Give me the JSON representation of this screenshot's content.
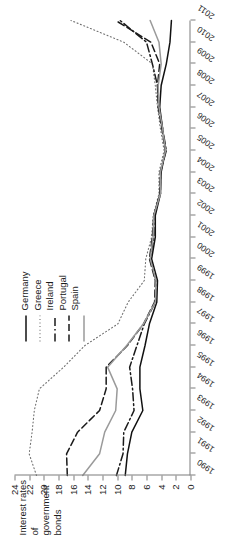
{
  "chart_data": {
    "type": "line",
    "title": "",
    "ylabel": "Interest rates of government bonds",
    "xlabel": "",
    "grid": false,
    "legend_position": "top-right",
    "ylim": [
      0,
      24
    ],
    "ytick_labels": [
      "0",
      "2",
      "4",
      "6",
      "8",
      "10",
      "12",
      "14",
      "16",
      "18",
      "20",
      "22",
      "24"
    ],
    "xlim": [
      1990,
      2011
    ],
    "x": [
      1990,
      1991,
      1992,
      1993,
      1994,
      1995,
      1996,
      1997,
      1998,
      1999,
      2000,
      2001,
      2002,
      2003,
      2004,
      2005,
      2006,
      2007,
      2008,
      2009,
      2010,
      2011
    ],
    "xtick_labels": [
      "1990",
      "1991",
      "1992",
      "1993",
      "1994",
      "1995",
      "1996",
      "1997",
      "1998",
      "1999",
      "2000",
      "2001",
      "2002",
      "2003",
      "2004",
      "2005",
      "2006",
      "2007",
      "2008",
      "2009",
      "2010",
      "2011"
    ],
    "series": [
      {
        "name": "Germany",
        "style": "solid",
        "color": "#111111",
        "values": [
          8.9,
          8.6,
          8.0,
          6.5,
          6.9,
          6.9,
          6.2,
          5.6,
          4.6,
          4.5,
          5.3,
          4.8,
          4.8,
          4.1,
          4.0,
          3.4,
          3.8,
          4.2,
          4.0,
          3.3,
          2.8,
          2.6
        ]
      },
      {
        "name": "Greece",
        "style": "dotted",
        "color": "#6f6f6f",
        "values": [
          21.0,
          22.0,
          21.6,
          21.3,
          20.6,
          17.3,
          14.4,
          9.9,
          8.5,
          6.3,
          6.1,
          5.3,
          5.1,
          4.3,
          4.3,
          3.6,
          4.1,
          4.5,
          4.8,
          5.2,
          9.1,
          16.3
        ]
      },
      {
        "name": "Ireland",
        "style": "dashdot",
        "color": "#1a1a1a",
        "values": [
          10.1,
          9.2,
          9.1,
          7.7,
          7.9,
          8.3,
          7.3,
          6.3,
          4.8,
          4.7,
          5.5,
          5.0,
          5.0,
          4.1,
          4.1,
          3.3,
          3.8,
          4.3,
          4.5,
          5.2,
          6.0,
          9.6
        ]
      },
      {
        "name": "Portugal",
        "style": "dashed",
        "color": "#1a1a1a",
        "values": [
          16.8,
          16.9,
          15.4,
          12.4,
          11.5,
          11.5,
          8.6,
          6.4,
          4.9,
          4.8,
          5.6,
          5.2,
          5.0,
          4.2,
          4.1,
          3.4,
          3.9,
          4.4,
          4.5,
          4.2,
          5.4,
          10.2
        ]
      },
      {
        "name": "Spain",
        "style": "solid",
        "color": "#9a9a9a",
        "values": [
          14.7,
          12.4,
          11.7,
          10.2,
          10.0,
          11.3,
          8.7,
          6.4,
          4.8,
          4.7,
          5.5,
          5.1,
          5.0,
          4.1,
          4.1,
          3.4,
          3.8,
          4.3,
          4.4,
          4.0,
          4.3,
          5.5
        ]
      }
    ]
  },
  "axis_title": {
    "line1": "Interest rates of",
    "line2": "government bonds"
  },
  "legend": {
    "items": [
      {
        "label": "Germany"
      },
      {
        "label": "Greece"
      },
      {
        "label": "Ireland"
      },
      {
        "label": "Portugal"
      },
      {
        "label": "Spain"
      }
    ]
  }
}
